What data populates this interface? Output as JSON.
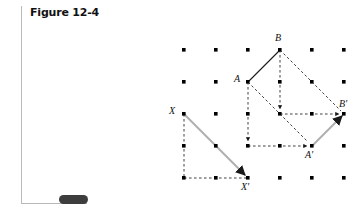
{
  "figure": {
    "title": "Figure 12-4",
    "nav_pill": "page-marker"
  },
  "colors": {
    "dot": "#000000",
    "solid_segment": "#1a1a1a",
    "vector_arrow": "#b0b0b0",
    "guide_dash": "#2b2b2b",
    "frame_rule": "#b9b9b9",
    "pill": "#3d3d3d",
    "background": "#ffffff"
  },
  "diagram": {
    "type": "geometry-translation-lattice",
    "grid": {
      "cols": 6,
      "rows": 5,
      "spacing": 32,
      "origin_x": 184,
      "origin_y": 50,
      "xs": [
        184,
        216,
        248,
        280,
        312,
        344
      ],
      "ys": [
        50,
        82,
        114,
        146,
        178
      ]
    },
    "points": [
      {
        "id": "A",
        "label": "A",
        "x": 248,
        "y": 82,
        "label_x": 234,
        "label_y": 73
      },
      {
        "id": "B",
        "label": "B",
        "x": 280,
        "y": 50,
        "label_x": 275,
        "label_y": 33
      },
      {
        "id": "Ap",
        "label": "A'",
        "x": 312,
        "y": 146,
        "label_x": 305,
        "label_y": 150
      },
      {
        "id": "Bp",
        "label": "B'",
        "x": 344,
        "y": 114,
        "label_x": 340,
        "label_y": 99
      },
      {
        "id": "X",
        "label": "X",
        "x": 184,
        "y": 114,
        "label_x": 169,
        "label_y": 105
      },
      {
        "id": "Xp",
        "label": "X'",
        "x": 248,
        "y": 178,
        "label_x": 241,
        "label_y": 182
      }
    ],
    "translation_vector": {
      "dx": 64,
      "dy": 64,
      "cells_right": 2,
      "cells_down": 2
    },
    "segments": {
      "solid": [
        {
          "from": "A",
          "to": "B"
        }
      ],
      "vectors": [
        {
          "from": "A",
          "to": "Ap"
        },
        {
          "from": "B",
          "to": "Bp"
        },
        {
          "from": "X",
          "to": "Xp"
        },
        {
          "from": "Ap",
          "to": "Bp"
        }
      ],
      "guides": [
        {
          "from": "A",
          "to": [
            248,
            146
          ],
          "axis": "vertical"
        },
        {
          "from": [
            248,
            146
          ],
          "to": "Ap",
          "axis": "horizontal"
        },
        {
          "from": "B",
          "to": [
            280,
            114
          ],
          "axis": "vertical"
        },
        {
          "from": [
            280,
            114
          ],
          "to": "Bp",
          "axis": "horizontal"
        },
        {
          "from": "X",
          "to": [
            184,
            178
          ],
          "axis": "vertical"
        },
        {
          "from": [
            184,
            178
          ],
          "to": "Xp",
          "axis": "horizontal"
        }
      ]
    },
    "captions": []
  }
}
